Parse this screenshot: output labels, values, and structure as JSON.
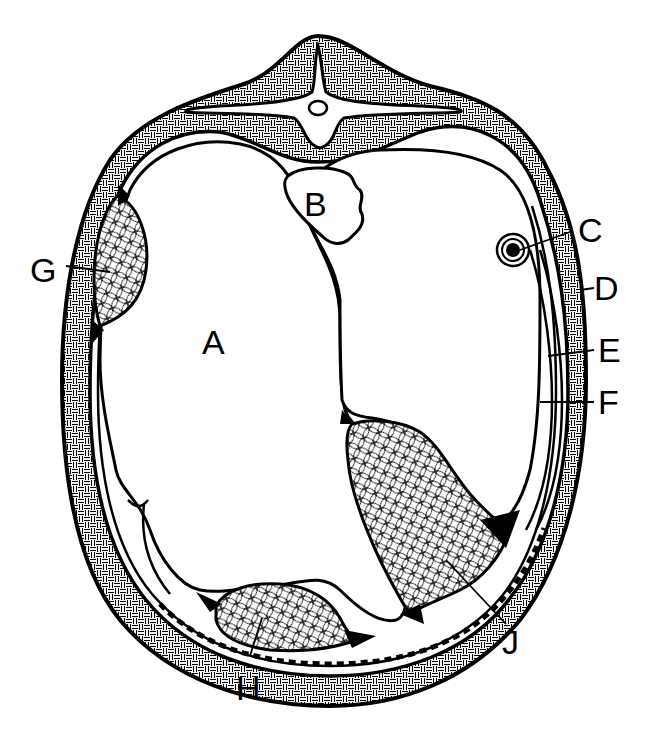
{
  "figure": {
    "type": "labeled anatomical cross-section diagram",
    "colors": {
      "ink": "#000000",
      "background": "#ffffff"
    },
    "labels": {
      "A": "A",
      "B": "B",
      "C": "C",
      "D": "D",
      "E": "E",
      "F": "F",
      "G": "G",
      "H": "H",
      "J": "J"
    }
  }
}
